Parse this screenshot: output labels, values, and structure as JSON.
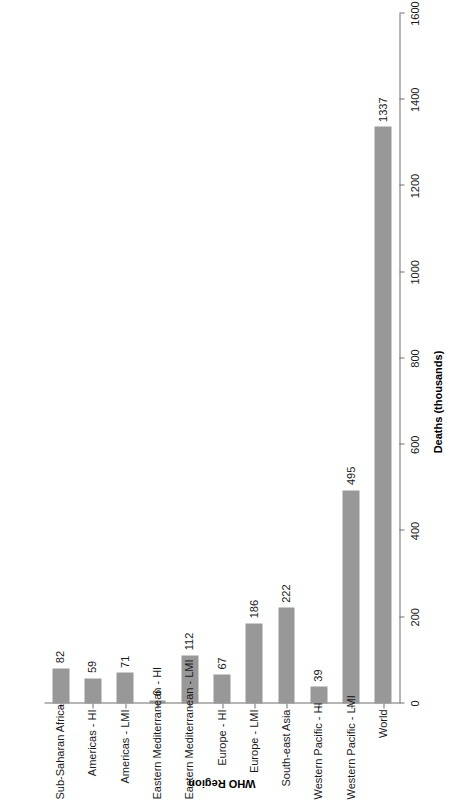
{
  "chart_data": {
    "type": "bar",
    "orientation": "vertical-rotated",
    "title": "",
    "subtitle": "",
    "xlabel": "WHO Region",
    "ylabel": "Deaths (thousands)",
    "categories": [
      "Sub-Saharan Africa",
      "Americas - HI",
      "Americas - LMI",
      "Eastern Mediterranean - HI",
      "Eastern Mediterranean - LMI",
      "Europe - HI",
      "Europe - LMI",
      "South-east Asia",
      "Western Pacific - HI",
      "Western Pacific - LMI",
      "World"
    ],
    "values": [
      82,
      59,
      71,
      6,
      112,
      67,
      186,
      222,
      39,
      495,
      1337
    ],
    "value_labels": [
      "82",
      "59",
      "71",
      "6",
      "112",
      "67",
      "186",
      "222",
      "39",
      "495",
      "1337"
    ],
    "ylim": [
      0,
      1600
    ],
    "tick_labels": [
      "0",
      "200",
      "400",
      "600",
      "800",
      "1000",
      "1200",
      "1400",
      "1600"
    ],
    "tick_values": [
      0,
      200,
      400,
      600,
      800,
      1000,
      1200,
      1400,
      1600
    ],
    "grid": false,
    "legend": "none",
    "bar_color": "#989898",
    "axis_color": "#6e6e6e",
    "text_color": "#1a1a1a"
  }
}
